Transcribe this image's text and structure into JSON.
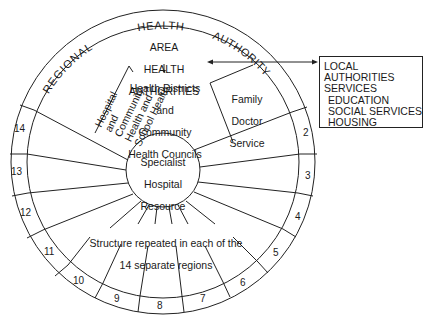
{
  "diagram": {
    "outer_ring_text": {
      "word1": "REGIONAL",
      "word2": "HEALTH",
      "word3": "AUTHORITY"
    },
    "area_authorities": {
      "line1": "AREA",
      "line2": "HEALTH",
      "line3": "AUTHORITIES"
    },
    "districts": {
      "line1": "Health Districts",
      "line2": "and",
      "line3": "Community",
      "line4": "Health Councils"
    },
    "hospital_wedge": {
      "line1": "Hospital",
      "line2": "and",
      "line3": "Community",
      "line4": "Health and",
      "line5": "School Health"
    },
    "family_doctor": {
      "line1": "Family",
      "line2": "Doctor",
      "line3": "Service"
    },
    "center": {
      "line1": "Specialist",
      "line2": "Hospital",
      "line3": "Resource"
    },
    "structure_note": {
      "line1": "Structure repeated in each of the",
      "line2": "14 separate regions"
    },
    "region_numbers": [
      "2",
      "3",
      "4",
      "5",
      "6",
      "7",
      "8",
      "9",
      "10",
      "11",
      "12",
      "13",
      "14"
    ],
    "local_authorities_box": {
      "line1": "LOCAL",
      "line2": "AUTHORITIES",
      "line3": "SERVICES",
      "line4": "EDUCATION",
      "line5": "SOCIAL SERVICES",
      "line6": "HOUSING"
    },
    "colors": {
      "line": "#222222",
      "text": "#1a1a1a",
      "background": "#ffffff"
    }
  }
}
